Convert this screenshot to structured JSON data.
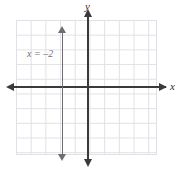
{
  "figure": {
    "name": "coordinate-plane-vertical-line",
    "background_color": "#ffffff"
  },
  "axes": {
    "x_label": "x",
    "y_label": "y",
    "axis_color": "#3a3a3a",
    "grid_color": "#e2e0e4",
    "x_arrow_right": "arrow-right",
    "x_arrow_left": "arrow-left",
    "y_arrow_up": "arrow-up",
    "y_arrow_down": "arrow-down"
  },
  "annotations": {
    "equation_label": "x = –2"
  },
  "chart_data": {
    "type": "line",
    "title": "",
    "xlabel": "x",
    "ylabel": "y",
    "grid": true,
    "legend": "none",
    "xlim": [
      -5,
      5
    ],
    "ylim": [
      -5,
      4
    ],
    "xticks": [
      -5,
      -4,
      -3,
      -2,
      -1,
      0,
      1,
      2,
      3,
      4,
      5
    ],
    "yticks": [
      -5,
      -4,
      -3,
      -2,
      -1,
      0,
      1,
      2,
      3,
      4
    ],
    "series": [
      {
        "name": "x = –2",
        "equation": "x = -2",
        "orientation": "vertical",
        "x_intercept": -2,
        "color": "#6e6e72",
        "arrows": "both",
        "points": [
          [
            -2,
            -4.5
          ],
          [
            -2,
            3.5
          ]
        ]
      }
    ]
  }
}
